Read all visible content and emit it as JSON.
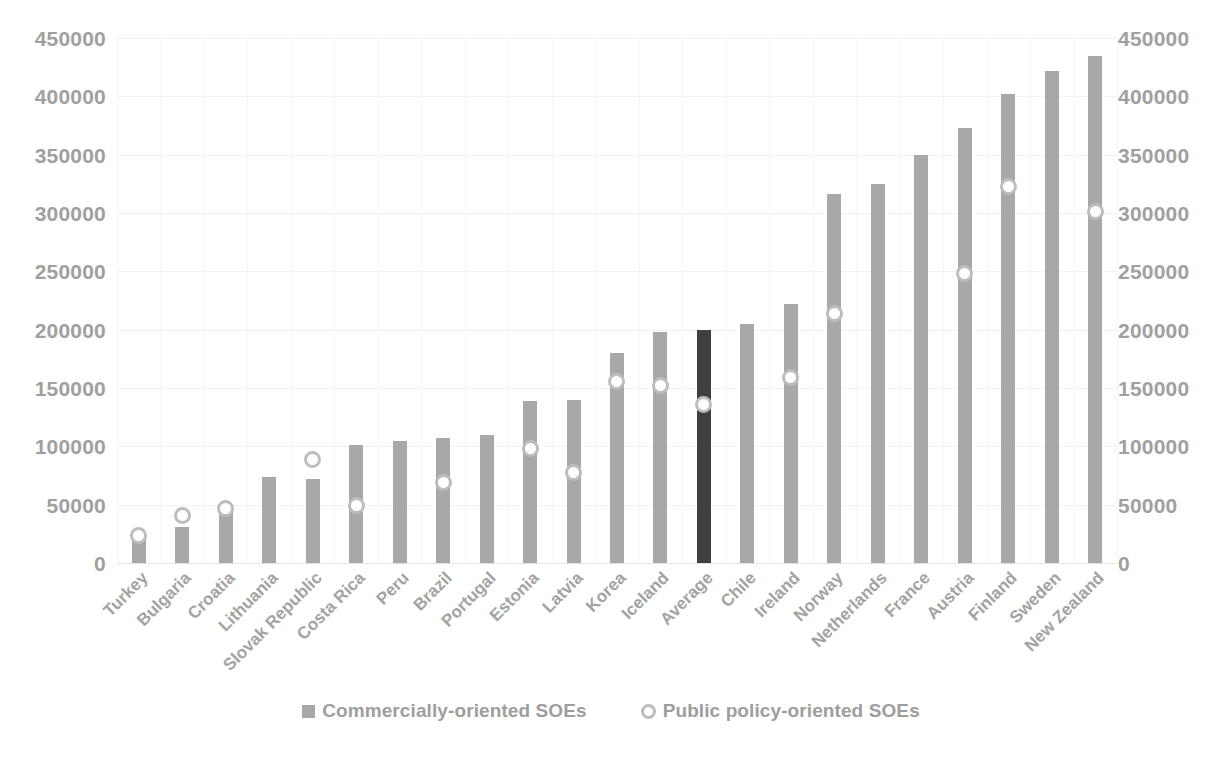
{
  "chart_data": {
    "type": "bar",
    "title": "",
    "subtitle": "",
    "xlabel": "",
    "ylabel": "",
    "ylim": [
      0,
      450000
    ],
    "ytick_step": 50000,
    "grid": true,
    "dual_axis": true,
    "legend_position": "bottom",
    "yticks": [
      "450000",
      "400000",
      "350000",
      "300000",
      "250000",
      "200000",
      "150000",
      "100000",
      "50000",
      "0"
    ],
    "yticks_right": [
      "450000",
      "400000",
      "350000",
      "300000",
      "250000",
      "200000",
      "150000",
      "100000",
      "50000",
      "0"
    ],
    "categories": [
      "Turkey",
      "Bulgaria",
      "Croatia",
      "Lithuania",
      "Slovak Republic",
      "Costa Rica",
      "Peru",
      "Brazil",
      "Portugal",
      "Estonia",
      "Latvia",
      "Korea",
      "Iceland",
      "Average",
      "Chile",
      "Ireland",
      "Norway",
      "Netherlands",
      "France",
      "Austria",
      "Finland",
      "Sweden",
      "New Zealand"
    ],
    "highlight_category": "Average",
    "series": [
      {
        "name": "Commercially-oriented SOEs",
        "type": "bar",
        "color": "#a8a8a8",
        "highlight_color": "#3f3f3f",
        "values": [
          21000,
          31000,
          44000,
          74000,
          72000,
          101000,
          105000,
          107000,
          110000,
          139000,
          140000,
          180000,
          198000,
          200000,
          205000,
          222000,
          316000,
          325000,
          350000,
          373000,
          402000,
          422000,
          435000
        ]
      },
      {
        "name": "Public policy-oriented SOEs",
        "type": "scatter",
        "marker": "circle",
        "color": "#bdbdbd",
        "values": [
          24000,
          41000,
          47000,
          null,
          89000,
          49000,
          null,
          69000,
          null,
          98000,
          78000,
          156000,
          152000,
          136000,
          null,
          159000,
          214000,
          null,
          null,
          248000,
          323000,
          null,
          301000
        ]
      }
    ]
  },
  "legend": {
    "items": [
      {
        "label": "Commercially-oriented SOEs",
        "icon": "square-swatch-icon"
      },
      {
        "label": "Public policy-oriented SOEs",
        "icon": "circle-swatch-icon"
      }
    ]
  }
}
